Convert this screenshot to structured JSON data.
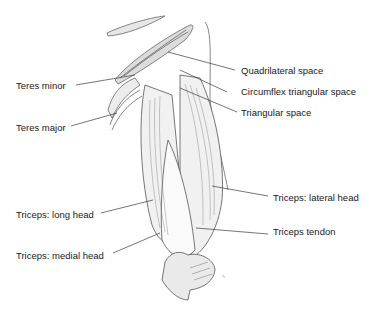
{
  "diagram": {
    "labels": {
      "teres_minor": "Teres minor",
      "teres_major": "Teres major",
      "quadrilateral_space": "Quadrilateral space",
      "circumflex_triangular_space": "Circumflex triangular space",
      "triangular_space": "Triangular space",
      "triceps_lateral_head": "Triceps: lateral head",
      "triceps_long_head": "Triceps: long head",
      "triceps_tendon": "Triceps tendon",
      "triceps_medial_head": "Triceps: medial head"
    },
    "colors": {
      "ink": "#333333",
      "leader": "#3a3a3a",
      "background": "#ffffff"
    }
  }
}
